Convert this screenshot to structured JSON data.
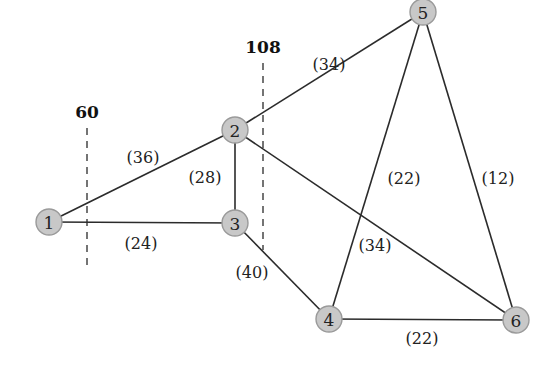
{
  "diagram": {
    "type": "weighted-undirected-graph",
    "nodes": [
      {
        "id": "1",
        "label": "1",
        "x": 49,
        "y": 222
      },
      {
        "id": "2",
        "label": "2",
        "x": 235,
        "y": 130
      },
      {
        "id": "3",
        "label": "3",
        "x": 235,
        "y": 223
      },
      {
        "id": "4",
        "label": "4",
        "x": 329,
        "y": 319
      },
      {
        "id": "5",
        "label": "5",
        "x": 423,
        "y": 12
      },
      {
        "id": "6",
        "label": "6",
        "x": 516,
        "y": 320
      }
    ],
    "edges": [
      {
        "from": "1",
        "to": "2",
        "weight": "(36)",
        "lx": 143,
        "ly": 157
      },
      {
        "from": "1",
        "to": "3",
        "weight": "(24)",
        "lx": 141,
        "ly": 243
      },
      {
        "from": "2",
        "to": "3",
        "weight": "(28)",
        "lx": 205,
        "ly": 177
      },
      {
        "from": "2",
        "to": "5",
        "weight": "(34)",
        "lx": 329,
        "ly": 64
      },
      {
        "from": "2",
        "to": "6",
        "weight": "(34)",
        "lx": 375,
        "ly": 245
      },
      {
        "from": "3",
        "to": "4",
        "weight": "(40)",
        "lx": 252,
        "ly": 272
      },
      {
        "from": "4",
        "to": "5",
        "weight": "(22)",
        "lx": 404,
        "ly": 178
      },
      {
        "from": "5",
        "to": "6",
        "weight": "(12)",
        "lx": 498,
        "ly": 178
      },
      {
        "from": "4",
        "to": "6",
        "weight": "(22)",
        "lx": 422,
        "ly": 338
      }
    ],
    "cut_lines": [
      {
        "label": "60",
        "x": 87,
        "y1": 128,
        "y2": 265,
        "label_y": 112
      },
      {
        "label": "108",
        "x": 263,
        "y1": 63,
        "y2": 250,
        "label_y": 47
      }
    ]
  }
}
